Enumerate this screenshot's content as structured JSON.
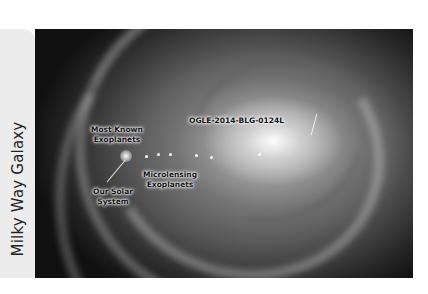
{
  "sidebar": {
    "title": "Milky Way Galaxy"
  },
  "figure": {
    "labels": {
      "most_known_line1": "Most Known",
      "most_known_line2": "Exoplanets",
      "ogle": "OGLE-2014-BLG-0124L",
      "microlensing_line1": "Microlensing",
      "microlensing_line2": "Exoplanets",
      "solar_line1": "Our Solar",
      "solar_line2": "System"
    }
  }
}
